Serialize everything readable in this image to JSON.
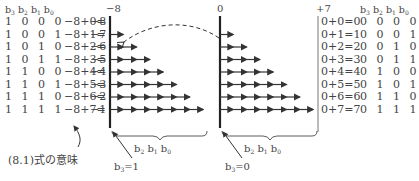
{
  "left_table": {
    "header": [
      "b3",
      "b2",
      "b1",
      "b0"
    ],
    "rows": [
      {
        "bits": "1 0 0 0",
        "expr": "−8+0=",
        "value": "−8"
      },
      {
        "bits": "1 0 0 1",
        "expr": "−8+1=",
        "value": "−7"
      },
      {
        "bits": "1 0 1 0",
        "expr": "−8+2=",
        "value": "−6"
      },
      {
        "bits": "1 0 1 1",
        "expr": "−8+3=",
        "value": "−5"
      },
      {
        "bits": "1 1 0 0",
        "expr": "−8+4=",
        "value": "−4"
      },
      {
        "bits": "1 1 0 1",
        "expr": "−8+5=",
        "value": "−3"
      },
      {
        "bits": "1 1 1 0",
        "expr": "−8+6=",
        "value": "−2"
      },
      {
        "bits": "1 1 1 1",
        "expr": "−8+7=",
        "value": "−1"
      }
    ]
  },
  "right_table": {
    "header": [
      "b3",
      "b2",
      "b1",
      "b0"
    ],
    "rows": [
      {
        "expr": "0+0=0",
        "bits": "0 0 0 0"
      },
      {
        "expr": "0+1=1",
        "bits": "0 0 0 1"
      },
      {
        "expr": "0+2=2",
        "bits": "0 0 1 0"
      },
      {
        "expr": "0+3=3",
        "bits": "0 0 1 1"
      },
      {
        "expr": "0+4=4",
        "bits": "0 1 0 0"
      },
      {
        "expr": "0+5=5",
        "bits": "0 1 0 1"
      },
      {
        "expr": "0+6=6",
        "bits": "0 1 1 0"
      },
      {
        "expr": "0+7=7",
        "bits": "0 1 1 1"
      }
    ]
  },
  "axes": {
    "left_label": "−8",
    "mid_label": "0",
    "right_label": "+7"
  },
  "labels": {
    "left_brace": "b2 b1 b0",
    "right_brace": "b2 b1 b0",
    "left_sign": "b3=1",
    "right_sign": "b3=0",
    "caption": "(8.1)式の意味"
  },
  "colors": {
    "ink": "#333333",
    "text": "#444444"
  }
}
